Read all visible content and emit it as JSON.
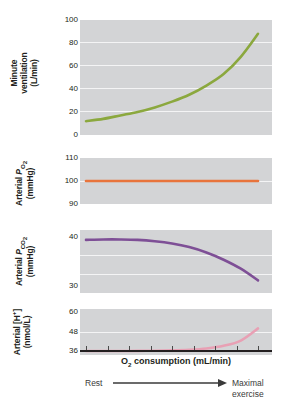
{
  "chart_data": {
    "type": "line",
    "title": "",
    "xlabel": "O2 consumption (mL/min)",
    "x_annotation_left": "Rest",
    "x_annotation_right_line1": "Maximal",
    "x_annotation_right_line2": "exercise",
    "x": [
      0,
      10,
      20,
      30,
      40,
      50,
      60,
      70,
      80,
      90,
      100
    ],
    "panels": [
      {
        "id": "minute-ventilation",
        "ylabel_line1": "Minute",
        "ylabel_line2": "ventilation",
        "ylabel_line3": "(L/min)",
        "ylabel_plain": "Minute ventilation (L/min)",
        "unit": "L/min",
        "yticks": [
          0,
          20,
          40,
          60,
          80,
          100
        ],
        "ylim": [
          0,
          100
        ],
        "color": "#8ba83e",
        "values": [
          12,
          14,
          17,
          20,
          24,
          29,
          35,
          43,
          53,
          68,
          88
        ]
      },
      {
        "id": "arterial-po2",
        "ylabel_line1": "Arterial PO2",
        "ylabel_line2": "(mmHg)",
        "ylabel_plain": "Arterial PO2 (mmHg)",
        "unit": "mmHg",
        "yticks": [
          90,
          100,
          110
        ],
        "ylim": [
          90,
          110
        ],
        "color": "#e8743c",
        "values": [
          100,
          100,
          100,
          100,
          100,
          100,
          100,
          100,
          100,
          100,
          100
        ]
      },
      {
        "id": "arterial-pco2",
        "ylabel_line1": "Arterial PCO2",
        "ylabel_line2": "(mmHg)",
        "ylabel_plain": "Arterial PCO2 (mmHg)",
        "unit": "mmHg",
        "yticks": [
          30,
          40
        ],
        "ylim": [
          28,
          42
        ],
        "color": "#7e4f96",
        "values": [
          39.8,
          39.9,
          39.9,
          39.8,
          39.5,
          39.0,
          38.2,
          37.0,
          35.4,
          33.4,
          30.8
        ]
      },
      {
        "id": "arterial-h",
        "ylabel_line1": "Arterial [H+]",
        "ylabel_line2": "(nmol/L)",
        "ylabel_plain": "Arterial [H+] (nmol/L)",
        "unit": "nmol/L",
        "yticks": [
          36,
          48,
          60
        ],
        "ylim": [
          34,
          62
        ],
        "color": "#e8a0b4",
        "values": [
          36.4,
          36.4,
          36.4,
          36.5,
          36.6,
          36.8,
          37.2,
          38.0,
          39.6,
          42.8,
          50.2
        ]
      }
    ],
    "grid": true,
    "legend": "none",
    "background": "#d3d4d6",
    "gridline_color": "#f4f4f5"
  }
}
